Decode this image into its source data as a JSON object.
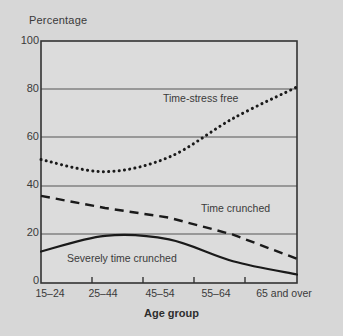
{
  "chart_data": {
    "type": "line",
    "title": "",
    "xlabel": "Age group",
    "ylabel": "Percentage",
    "categories": [
      "15–24",
      "25–44",
      "45–54",
      "55–64",
      "65 and over"
    ],
    "ylim": [
      0,
      100
    ],
    "yticks": [
      0,
      20,
      40,
      60,
      80,
      100
    ],
    "grid": "horizontal",
    "legend_position": "inline-annotations",
    "series": [
      {
        "name": "Time-stress free",
        "style": "dotted",
        "color": "#1a1a1a",
        "values": [
          51,
          46,
          52,
          68,
          81
        ]
      },
      {
        "name": "Time crunched",
        "style": "dashed",
        "color": "#1a1a1a",
        "values": [
          36,
          31,
          27,
          20,
          10
        ]
      },
      {
        "name": "Severely time crunched",
        "style": "solid",
        "color": "#1a1a1a",
        "values": [
          13,
          19.5,
          18,
          9,
          3.5
        ]
      }
    ]
  },
  "axes": {
    "y_title": "Percentage",
    "x_title": "Age group",
    "y_tick_labels": [
      "100",
      "80",
      "60",
      "40",
      "20",
      "0"
    ],
    "x_tick_labels": [
      "15–24",
      "25–44",
      "45–54",
      "55–64",
      "65 and over"
    ]
  },
  "annotations": {
    "time_stress_free": "Time-stress free",
    "time_crunched": "Time crunched",
    "severely_time_crunched": "Severely time crunched"
  },
  "colors": {
    "background": "#d7d7d7",
    "plot_background": "#dcdcdc",
    "line": "#1a1a1a",
    "grid": "#555555",
    "text": "#3a3a3a"
  }
}
